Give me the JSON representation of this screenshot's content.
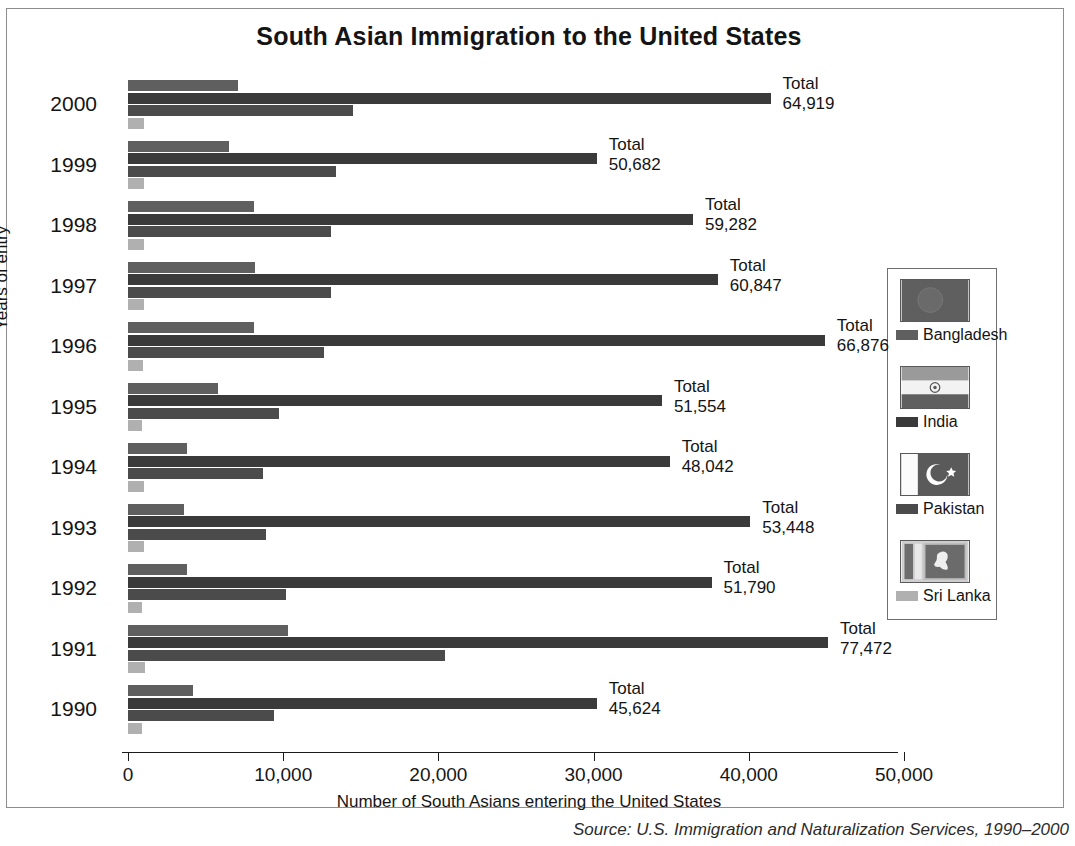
{
  "frame": {
    "border_color": "#8d8d8d"
  },
  "chart_data": {
    "type": "bar",
    "orientation": "horizontal",
    "grouped": true,
    "title": "South Asian Immigration to the United States",
    "xlabel": "Number of South Asians entering the United States",
    "ylabel": "Years of entry",
    "xlim": [
      0,
      50000
    ],
    "xticks": [
      0,
      10000,
      20000,
      30000,
      40000,
      50000
    ],
    "xtick_labels": [
      "0",
      "10,000",
      "20,000",
      "30,000",
      "40,000",
      "50,000"
    ],
    "grid": false,
    "legend_position": "right",
    "categories": [
      "2000",
      "1999",
      "1998",
      "1997",
      "1996",
      "1995",
      "1994",
      "1993",
      "1992",
      "1991",
      "1990"
    ],
    "series": [
      {
        "name": "Bangladesh",
        "color": "#5f5f5f",
        "values": [
          7100,
          6500,
          8100,
          8200,
          8100,
          5800,
          3800,
          3600,
          3800,
          10300,
          4200
        ]
      },
      {
        "name": "India",
        "color": "#3a3a3a",
        "values": [
          41400,
          30200,
          36400,
          38000,
          44900,
          34400,
          34900,
          40100,
          37600,
          45100,
          30200
        ]
      },
      {
        "name": "Pakistan",
        "color": "#4b4b4b",
        "values": [
          14500,
          13400,
          13100,
          13100,
          12600,
          9700,
          8700,
          8900,
          10200,
          20400,
          9400
        ]
      },
      {
        "name": "Sri Lanka",
        "color": "#b0b0b0",
        "values": [
          1000,
          1000,
          1000,
          1000,
          950,
          900,
          1000,
          1000,
          900,
          1100,
          900
        ]
      }
    ],
    "totals_label": "Total",
    "totals": [
      "64,919",
      "50,682",
      "59,282",
      "60,847",
      "66,876",
      "51,554",
      "48,042",
      "53,448",
      "51,790",
      "77,472",
      "45,624"
    ]
  },
  "legend": {
    "items": [
      {
        "label": "Bangladesh",
        "color": "#5f5f5f",
        "flag": "bangladesh-flag"
      },
      {
        "label": "India",
        "color": "#3a3a3a",
        "flag": "india-flag"
      },
      {
        "label": "Pakistan",
        "color": "#4b4b4b",
        "flag": "pakistan-flag"
      },
      {
        "label": "Sri Lanka",
        "color": "#b0b0b0",
        "flag": "sri-lanka-flag"
      }
    ]
  },
  "source": "Source: U.S. Immigration and Naturalization Services, 1990–2000"
}
